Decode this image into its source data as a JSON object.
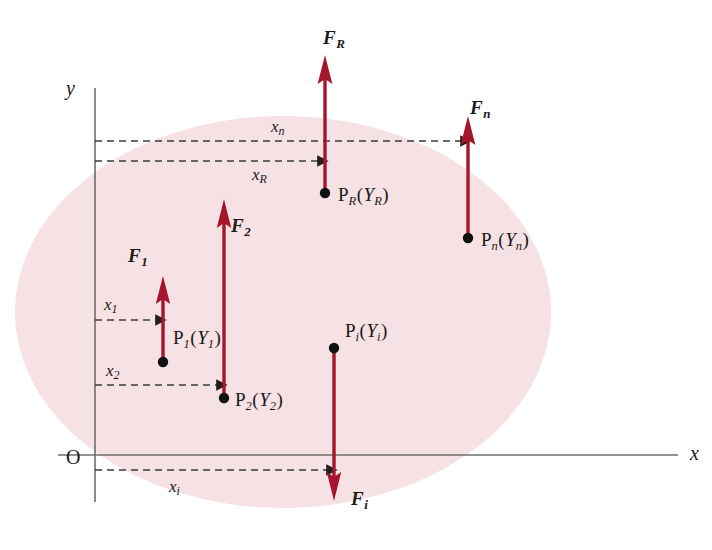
{
  "figure": {
    "type": "free-body-diagram",
    "colors": {
      "force_arrow": "#A5152C",
      "body_fill": "#F6E1E4",
      "axis": "#6E6E6E",
      "dashed_dimension": "#3A3A3A",
      "text": "#1A1A1A",
      "background": "#FFFFFF"
    }
  },
  "axes": {
    "x_label": "x",
    "y_label": "y",
    "origin_label": "O"
  },
  "forces": [
    {
      "id": "F1",
      "name": "F",
      "subscript": "1",
      "direction": "up",
      "point_name": "P",
      "point_subscript": "1",
      "point_value": "Y",
      "point_value_subscript": "1",
      "dimension": "x",
      "dimension_subscript": "1"
    },
    {
      "id": "F2",
      "name": "F",
      "subscript": "2",
      "direction": "up",
      "point_name": "P",
      "point_subscript": "2",
      "point_value": "Y",
      "point_value_subscript": "2",
      "dimension": "x",
      "dimension_subscript": "2"
    },
    {
      "id": "Fi",
      "name": "F",
      "subscript": "i",
      "direction": "down",
      "point_name": "P",
      "point_subscript": "i",
      "point_value": "Y",
      "point_value_subscript": "i",
      "dimension": "x",
      "dimension_subscript": "i"
    },
    {
      "id": "Fn",
      "name": "F",
      "subscript": "n",
      "direction": "up",
      "point_name": "P",
      "point_subscript": "n",
      "point_value": "Y",
      "point_value_subscript": "n",
      "dimension": "x",
      "dimension_subscript": "n"
    },
    {
      "id": "FR",
      "name": "F",
      "subscript": "R",
      "direction": "up",
      "point_name": "P",
      "point_subscript": "R",
      "point_value": "Y",
      "point_value_subscript": "R",
      "dimension": "x",
      "dimension_subscript": "R"
    }
  ]
}
